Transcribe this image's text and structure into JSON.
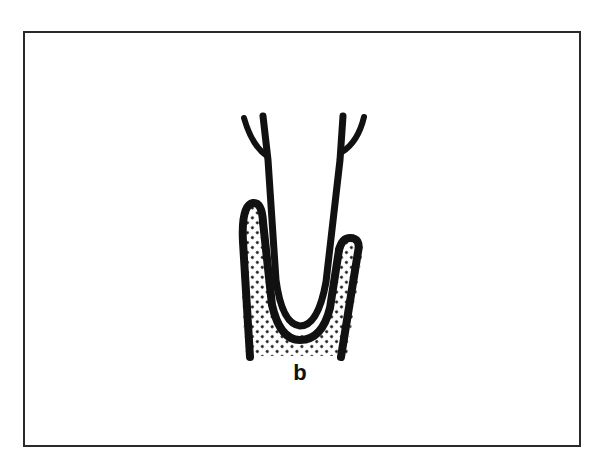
{
  "figure": {
    "panel_label": "b",
    "colors": {
      "stroke": "#111111",
      "frame": "#2a2a2a",
      "background": "#ffffff",
      "stipple": "#111111"
    },
    "elements": [
      {
        "name": "tooth-root",
        "description": "U-shaped root with forked upper ends"
      },
      {
        "name": "periodontal-space",
        "description": "thin white gap between root and socket"
      },
      {
        "name": "alveolar-bone",
        "description": "stippled bone surrounding root, left crest higher than right"
      }
    ]
  }
}
